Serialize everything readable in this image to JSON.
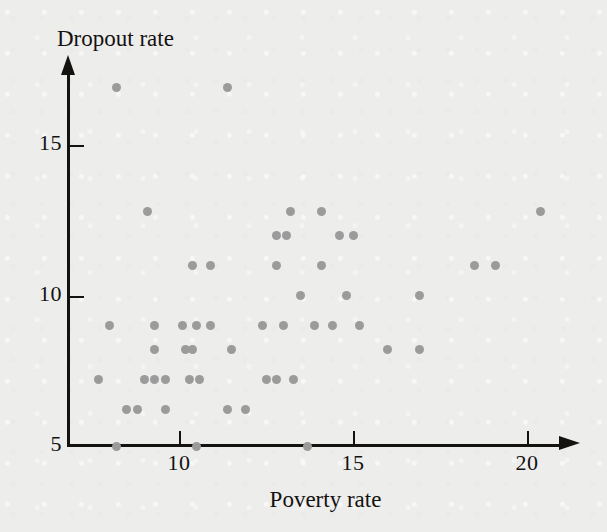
{
  "chart_data": {
    "type": "scatter",
    "title": "",
    "xlabel": "Poverty rate",
    "ylabel": "Dropout rate",
    "xlim": [
      7.3,
      21.2
    ],
    "ylim": [
      5,
      17.6
    ],
    "xticks": [
      10,
      15,
      20
    ],
    "xtick_labels": [
      "10",
      "15",
      "20"
    ],
    "yticks": [
      5,
      10,
      15
    ],
    "ytick_labels": [
      "5",
      "10",
      "15"
    ],
    "grid": false,
    "legend": null,
    "marker_color": "#9b9b9b",
    "axis_color": "#15130f",
    "background_color": "#ededec",
    "points": [
      [
        8.2,
        16.9
      ],
      [
        11.4,
        16.9
      ],
      [
        9.1,
        12.8
      ],
      [
        13.2,
        12.8
      ],
      [
        14.1,
        12.8
      ],
      [
        20.4,
        12.8
      ],
      [
        12.8,
        12.0
      ],
      [
        13.1,
        12.0
      ],
      [
        14.6,
        12.0
      ],
      [
        15.0,
        12.0
      ],
      [
        10.4,
        11.0
      ],
      [
        10.9,
        11.0
      ],
      [
        12.8,
        11.0
      ],
      [
        14.1,
        11.0
      ],
      [
        18.5,
        11.0
      ],
      [
        19.1,
        11.0
      ],
      [
        13.5,
        10.0
      ],
      [
        14.8,
        10.0
      ],
      [
        16.9,
        10.0
      ],
      [
        8.0,
        9.0
      ],
      [
        9.3,
        9.0
      ],
      [
        10.1,
        9.0
      ],
      [
        10.5,
        9.0
      ],
      [
        10.9,
        9.0
      ],
      [
        12.4,
        9.0
      ],
      [
        13.0,
        9.0
      ],
      [
        13.9,
        9.0
      ],
      [
        14.4,
        9.0
      ],
      [
        15.2,
        9.0
      ],
      [
        9.3,
        8.2
      ],
      [
        10.2,
        8.2
      ],
      [
        10.4,
        8.2
      ],
      [
        11.5,
        8.2
      ],
      [
        16.0,
        8.2
      ],
      [
        16.9,
        8.2
      ],
      [
        7.7,
        7.2
      ],
      [
        9.0,
        7.2
      ],
      [
        9.3,
        7.2
      ],
      [
        9.6,
        7.2
      ],
      [
        10.3,
        7.2
      ],
      [
        10.6,
        7.2
      ],
      [
        12.5,
        7.2
      ],
      [
        12.8,
        7.2
      ],
      [
        13.3,
        7.2
      ],
      [
        8.5,
        6.2
      ],
      [
        8.8,
        6.2
      ],
      [
        9.6,
        6.2
      ],
      [
        11.4,
        6.2
      ],
      [
        11.9,
        6.2
      ],
      [
        8.2,
        5.0
      ],
      [
        10.5,
        5.0
      ],
      [
        13.7,
        5.0
      ]
    ]
  }
}
